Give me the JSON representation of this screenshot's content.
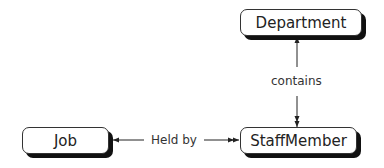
{
  "diagram": {
    "entities": [
      {
        "id": "department",
        "label": "Department"
      },
      {
        "id": "job",
        "label": "Job"
      },
      {
        "id": "staffmember",
        "label": "StaffMember"
      }
    ],
    "relationships": [
      {
        "from": "department",
        "to": "staffmember",
        "label": "contains",
        "to_cardinality": "many"
      },
      {
        "from": "job",
        "to": "staffmember",
        "label": "Held by",
        "to_cardinality": "many"
      }
    ]
  }
}
